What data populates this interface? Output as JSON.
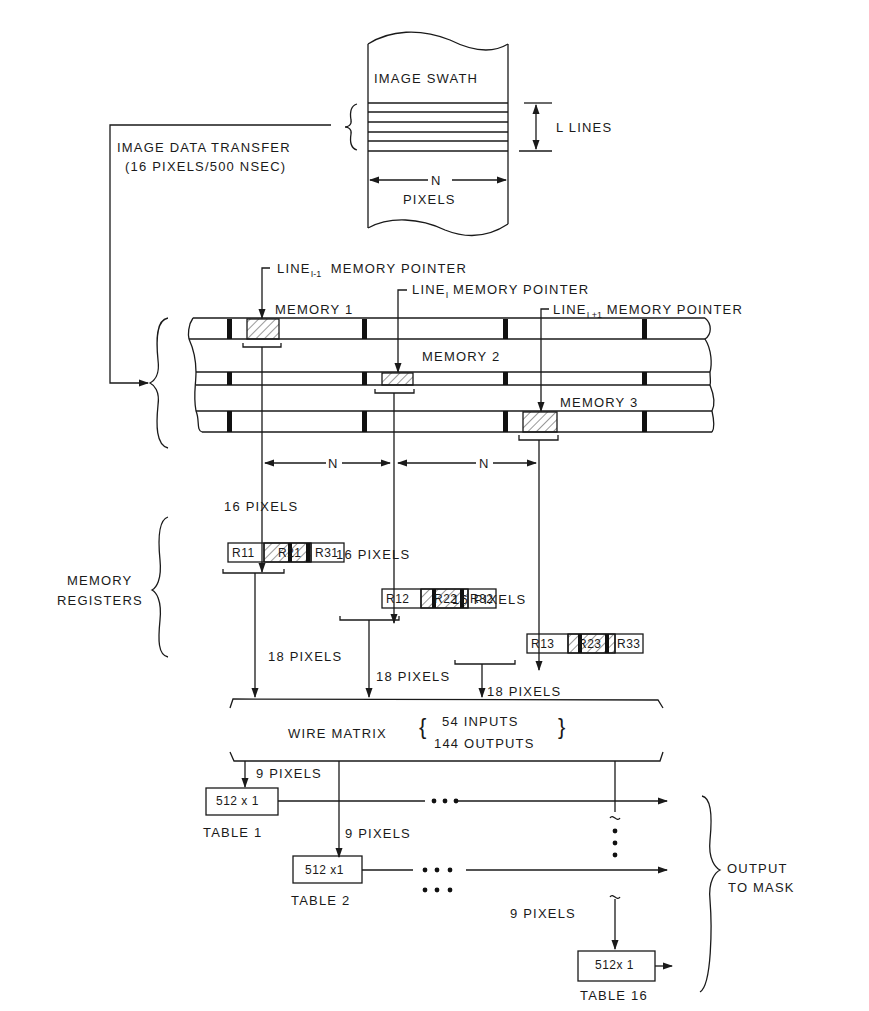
{
  "image_swath": {
    "title": "IMAGE SWATH",
    "lines_label": "L LINES",
    "width_label": "N",
    "width_unit": "PIXELS"
  },
  "transfer": {
    "line1": "IMAGE DATA TRANSFER",
    "line2": "(16 PIXELS/500 NSEC)"
  },
  "pointers": [
    {
      "prefix": "LINE",
      "subscript": "I-1",
      "suffix": "MEMORY POINTER"
    },
    {
      "prefix": "LINE",
      "subscript": "I",
      "suffix": "MEMORY POINTER"
    },
    {
      "prefix": "LINE",
      "subscript": "I +1",
      "suffix": "MEMORY POINTER"
    }
  ],
  "memories": [
    "MEMORY 1",
    "MEMORY 2",
    "MEMORY 3"
  ],
  "spacing": [
    "N",
    "N"
  ],
  "registers_label": {
    "line1": "MEMORY",
    "line2": "REGISTERS"
  },
  "register_inputs": [
    "16 PIXELS",
    "16 PIXELS",
    "16 PIXELS"
  ],
  "registers": [
    [
      "R11",
      "R21",
      "R31"
    ],
    [
      "R12",
      "R22",
      "R32"
    ],
    [
      "R13",
      "R23",
      "R33"
    ]
  ],
  "register_outputs": [
    "18 PIXELS",
    "18 PIXELS",
    "18 PIXELS"
  ],
  "wire_matrix": {
    "label": "WIRE MATRIX",
    "inputs": "54 INPUTS",
    "outputs": "144 OUTPUTS"
  },
  "tables": [
    {
      "size": "512 x 1",
      "name": "TABLE 1",
      "input": "9 PIXELS"
    },
    {
      "size": "512 x1",
      "name": "TABLE 2",
      "input": "9 PIXELS"
    },
    {
      "size": "512x 1",
      "name": "TABLE 16",
      "input": "9 PIXELS"
    }
  ],
  "output": {
    "line1": "OUTPUT",
    "line2": "TO MASK"
  }
}
